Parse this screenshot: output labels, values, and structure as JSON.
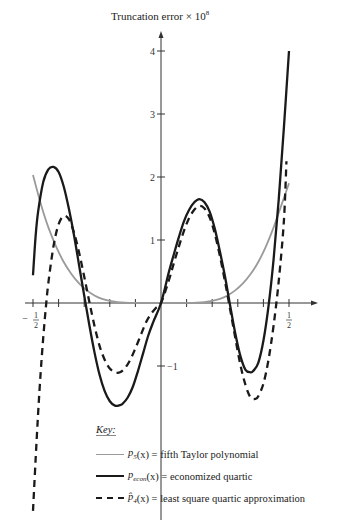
{
  "chart_data": {
    "type": "line",
    "title": "",
    "ylabel": "Truncation error × 10",
    "ylabel_exponent": "8",
    "xlabel": "",
    "xlim": [
      -0.5,
      0.5
    ],
    "ylim": [
      -3.3,
      4.2
    ],
    "x_ticks": [
      -0.5,
      -0.4,
      -0.3,
      -0.2,
      -0.1,
      0,
      0.1,
      0.2,
      0.3,
      0.4,
      0.5
    ],
    "x_tick_labels": [
      {
        "x": -0.5,
        "num": "1",
        "den": "2",
        "sign": "−"
      },
      {
        "x": 0.5,
        "num": "1",
        "den": "2",
        "sign": ""
      }
    ],
    "y_ticks": [
      -1,
      1,
      2,
      3,
      4
    ],
    "y_tick_labels": [
      "−1",
      "1",
      "2",
      "3",
      "4"
    ],
    "grid": false,
    "legend_position": "bottom",
    "legend_title": "Key:",
    "series": [
      {
        "name": "p5(x) = fifth Taylor polynomial",
        "label_func": "p",
        "label_sub": "5",
        "label_hat": false,
        "label_text": "(x) = fifth Taylor polynomial",
        "style": "solid",
        "color": "#9a9a9a",
        "x": [
          -0.5,
          -0.47,
          -0.44,
          -0.41,
          -0.38,
          -0.35,
          -0.32,
          -0.29,
          -0.26,
          -0.23,
          -0.2,
          -0.17,
          -0.14,
          -0.1,
          -0.05,
          0,
          0.05,
          0.1,
          0.14,
          0.17,
          0.2,
          0.23,
          0.26,
          0.29,
          0.32,
          0.35,
          0.38,
          0.41,
          0.44,
          0.47,
          0.5
        ],
        "y": [
          2.03,
          1.58,
          1.2,
          0.9,
          0.65,
          0.46,
          0.31,
          0.2,
          0.12,
          0.065,
          0.032,
          0.014,
          0.005,
          0.001,
          0.0,
          0.0,
          0.0,
          0.001,
          0.005,
          0.014,
          0.032,
          0.065,
          0.12,
          0.2,
          0.31,
          0.46,
          0.65,
          0.9,
          1.2,
          1.55,
          1.9
        ]
      },
      {
        "name": "pecon(x) = economized quartic",
        "label_func": "p",
        "label_sub": "econ",
        "label_hat": false,
        "label_text": "(x) = economized quartic",
        "style": "solid",
        "color": "#1a1a1a",
        "x": [
          -0.5,
          -0.49,
          -0.48,
          -0.46,
          -0.44,
          -0.42,
          -0.4,
          -0.38,
          -0.36,
          -0.34,
          -0.32,
          -0.3,
          -0.28,
          -0.26,
          -0.24,
          -0.22,
          -0.2,
          -0.18,
          -0.16,
          -0.15,
          -0.13,
          -0.11,
          -0.09,
          -0.07,
          -0.05,
          -0.03,
          0,
          0.03,
          0.05,
          0.07,
          0.09,
          0.11,
          0.13,
          0.15,
          0.17,
          0.19,
          0.21,
          0.23,
          0.25,
          0.27,
          0.29,
          0.31,
          0.33,
          0.35,
          0.36,
          0.38,
          0.4,
          0.42,
          0.44,
          0.46,
          0.48,
          0.5
        ],
        "y": [
          0.44,
          1.05,
          1.45,
          1.92,
          2.12,
          2.16,
          2.08,
          1.85,
          1.5,
          1.08,
          0.6,
          0.12,
          -0.35,
          -0.78,
          -1.14,
          -1.4,
          -1.56,
          -1.63,
          -1.62,
          -1.6,
          -1.5,
          -1.33,
          -1.08,
          -0.8,
          -0.52,
          -0.3,
          0.0,
          0.48,
          0.77,
          1.05,
          1.3,
          1.48,
          1.6,
          1.65,
          1.6,
          1.45,
          1.18,
          0.82,
          0.42,
          -0.04,
          -0.48,
          -0.84,
          -1.06,
          -1.1,
          -1.08,
          -0.95,
          -0.6,
          -0.05,
          0.7,
          1.65,
          2.78,
          4.0
        ]
      },
      {
        "name": "p̂4(x) = least square quartic approximation",
        "label_func": "p",
        "label_sub": "4",
        "label_hat": true,
        "label_text": "(x) = least square quartic approximation",
        "style": "dashed",
        "color": "#1a1a1a",
        "x": [
          -0.5,
          -0.49,
          -0.48,
          -0.47,
          -0.46,
          -0.45,
          -0.44,
          -0.42,
          -0.4,
          -0.38,
          -0.36,
          -0.34,
          -0.32,
          -0.3,
          -0.28,
          -0.26,
          -0.24,
          -0.22,
          -0.2,
          -0.18,
          -0.16,
          -0.14,
          -0.12,
          -0.1,
          -0.08,
          -0.06,
          -0.04,
          -0.02,
          0,
          0.03,
          0.05,
          0.07,
          0.09,
          0.11,
          0.13,
          0.15,
          0.17,
          0.19,
          0.21,
          0.23,
          0.25,
          0.27,
          0.29,
          0.31,
          0.33,
          0.35,
          0.37,
          0.38,
          0.4,
          0.42,
          0.44,
          0.46,
          0.48,
          0.49
        ],
        "y": [
          -3.3,
          -2.5,
          -1.75,
          -1.1,
          -0.55,
          -0.08,
          0.32,
          0.9,
          1.25,
          1.38,
          1.33,
          1.12,
          0.8,
          0.42,
          0.02,
          -0.36,
          -0.68,
          -0.9,
          -1.04,
          -1.1,
          -1.1,
          -1.03,
          -0.9,
          -0.72,
          -0.52,
          -0.32,
          -0.18,
          -0.08,
          0.0,
          0.35,
          0.63,
          0.9,
          1.15,
          1.35,
          1.48,
          1.54,
          1.5,
          1.36,
          1.1,
          0.75,
          0.34,
          -0.1,
          -0.55,
          -0.98,
          -1.3,
          -1.5,
          -1.52,
          -1.48,
          -1.28,
          -0.9,
          -0.35,
          0.35,
          1.3,
          2.25
        ]
      }
    ]
  }
}
